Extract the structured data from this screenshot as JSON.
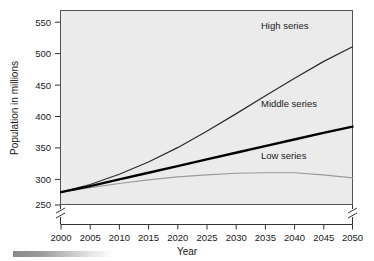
{
  "chart_data": {
    "type": "line",
    "title": "",
    "xlabel": "Year",
    "ylabel": "Population in millions",
    "xlim": [
      2000,
      2050
    ],
    "ylim": [
      250,
      560
    ],
    "grid": false,
    "legend_position": "inline-right",
    "y_axis_break": true,
    "x_ticks": [
      2000,
      2005,
      2010,
      2015,
      2020,
      2025,
      2030,
      2035,
      2040,
      2045,
      2050
    ],
    "x_tick_labels": [
      "2000",
      "2005",
      "2010",
      "2015",
      "2020",
      "2025",
      "2030",
      "2035",
      "2040",
      "2045",
      "2050"
    ],
    "y_ticks": [
      250,
      300,
      350,
      400,
      450,
      500,
      550
    ],
    "y_tick_labels": [
      "250",
      "300",
      "350",
      "400",
      "450",
      "500",
      "550"
    ],
    "x": [
      2000,
      2005,
      2010,
      2015,
      2020,
      2025,
      2030,
      2035,
      2040,
      2045,
      2050
    ],
    "series": [
      {
        "name": "High series",
        "color": "#2b2b2b",
        "width": 1.2,
        "values": [
          275,
          290,
          310,
          334,
          362,
          394,
          428,
          463,
          497,
          530,
          559
        ]
      },
      {
        "name": "Middle series",
        "color": "#000000",
        "width": 2.4,
        "values": [
          275,
          287,
          300,
          313,
          326,
          339,
          352,
          365,
          378,
          391,
          403
        ]
      },
      {
        "name": "Low series",
        "color": "#9a9a9a",
        "width": 1.2,
        "values": [
          275,
          284,
          292,
          299,
          305,
          309,
          312,
          313,
          313,
          309,
          303
        ]
      }
    ],
    "annotations": [
      {
        "text": "High series",
        "x": 2036,
        "y": 545
      },
      {
        "text": "Middle series",
        "x": 2036,
        "y": 421
      },
      {
        "text": "Low series",
        "x": 2036,
        "y": 339
      }
    ]
  }
}
